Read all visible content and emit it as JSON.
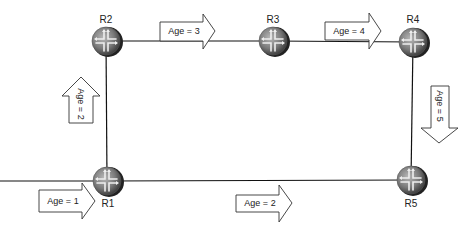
{
  "diagram": {
    "type": "network-topology",
    "routers": [
      {
        "id": "R1",
        "label": "R1",
        "x": 107,
        "y": 181,
        "label_pos": "below"
      },
      {
        "id": "R2",
        "label": "R2",
        "x": 106,
        "y": 41,
        "label_pos": "above"
      },
      {
        "id": "R3",
        "label": "R3",
        "x": 273,
        "y": 41,
        "label_pos": "above"
      },
      {
        "id": "R4",
        "label": "R4",
        "x": 413,
        "y": 42,
        "label_pos": "above"
      },
      {
        "id": "R5",
        "label": "R5",
        "x": 411,
        "y": 180,
        "label_pos": "below"
      }
    ],
    "links": [
      {
        "from": "external",
        "to": "R1"
      },
      {
        "from": "R1",
        "to": "R2"
      },
      {
        "from": "R2",
        "to": "R3"
      },
      {
        "from": "R3",
        "to": "R4"
      },
      {
        "from": "R4",
        "to": "R5"
      },
      {
        "from": "R1",
        "to": "R5"
      }
    ],
    "arrows": [
      {
        "label": "Age = 1",
        "direction": "right"
      },
      {
        "label": "Age = 2",
        "direction": "up"
      },
      {
        "label": "Age = 3",
        "direction": "right"
      },
      {
        "label": "Age = 4",
        "direction": "right"
      },
      {
        "label": "Age = 5",
        "direction": "down"
      },
      {
        "label": "Age = 2",
        "direction": "right"
      }
    ]
  }
}
